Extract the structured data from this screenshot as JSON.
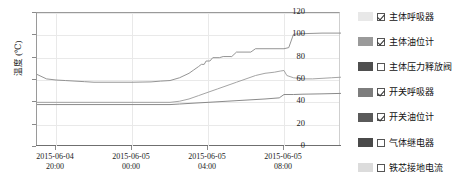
{
  "chart_data": {
    "type": "line",
    "title": "",
    "xlabel": "",
    "ylabel": "温度 (℃)",
    "ylim": [
      0,
      120
    ],
    "yticks": [
      0,
      20,
      40,
      60,
      80,
      100,
      120
    ],
    "grid": true,
    "legend_position": "right",
    "x_ticklabels": [
      {
        "date": "2015-06-04",
        "time": "20:00"
      },
      {
        "date": "2015-06-05",
        "time": "00:00"
      },
      {
        "date": "2015-06-05",
        "time": "04:00"
      },
      {
        "date": "2015-06-05",
        "time": "08:00"
      }
    ],
    "x_range_hours": [
      18,
      10
    ],
    "series": [
      {
        "name": "主体呼吸器",
        "color": "#e8e8e8",
        "visible": true,
        "points": [
          [
            0,
            65
          ],
          [
            1,
            61
          ],
          [
            2,
            60
          ],
          [
            3,
            59.5
          ],
          [
            4,
            59
          ],
          [
            5,
            58.5
          ],
          [
            6,
            58
          ],
          [
            8,
            58
          ],
          [
            10,
            58
          ],
          [
            12,
            58.3
          ],
          [
            13,
            59
          ],
          [
            14,
            59.5
          ],
          [
            15,
            62
          ],
          [
            16,
            66
          ],
          [
            16.5,
            69
          ],
          [
            17,
            72
          ],
          [
            17.3,
            74
          ],
          [
            17.6,
            74
          ],
          [
            17.8,
            77
          ],
          [
            18.2,
            77
          ],
          [
            18.5,
            80
          ],
          [
            19.2,
            80
          ],
          [
            19.6,
            81
          ],
          [
            20.5,
            81
          ],
          [
            21,
            85
          ],
          [
            22.5,
            85
          ],
          [
            23,
            88
          ],
          [
            26,
            88
          ],
          [
            26.5,
            89
          ],
          [
            27,
            101
          ],
          [
            28,
            101.5
          ],
          [
            30,
            102
          ],
          [
            32,
            102
          ]
        ]
      },
      {
        "name": "主体油位计",
        "color": "#9a9a9a",
        "visible": true,
        "points": [
          [
            0,
            40
          ],
          [
            4,
            40
          ],
          [
            8,
            40
          ],
          [
            12,
            40
          ],
          [
            14,
            40
          ],
          [
            15,
            41
          ],
          [
            16,
            43
          ],
          [
            17,
            46
          ],
          [
            18,
            49
          ],
          [
            19,
            52
          ],
          [
            20,
            55
          ],
          [
            21,
            58
          ],
          [
            22,
            61
          ],
          [
            23,
            64
          ],
          [
            24,
            66
          ],
          [
            25,
            67
          ],
          [
            25.6,
            68
          ],
          [
            26,
            68.5
          ],
          [
            26.3,
            64
          ],
          [
            27,
            62
          ],
          [
            28,
            61
          ],
          [
            29,
            61
          ],
          [
            30,
            61.5
          ],
          [
            31,
            62
          ],
          [
            32,
            62.5
          ]
        ]
      },
      {
        "name": "主体压力释放阀",
        "color": "#4f4f4f",
        "visible": false,
        "points": []
      },
      {
        "name": "开关呼吸器",
        "color": "#7d7d7d",
        "visible": true,
        "points": [
          [
            0,
            38
          ],
          [
            4,
            38
          ],
          [
            8,
            38
          ],
          [
            12,
            38
          ],
          [
            14,
            38
          ],
          [
            15,
            38.5
          ],
          [
            16,
            39
          ],
          [
            18,
            40
          ],
          [
            20,
            41
          ],
          [
            22,
            42
          ],
          [
            24,
            43
          ],
          [
            25.5,
            44
          ],
          [
            26,
            47
          ],
          [
            27,
            47
          ],
          [
            28,
            47.3
          ],
          [
            30,
            47.6
          ],
          [
            32,
            48
          ]
        ]
      },
      {
        "name": "开关油位计",
        "color": "#5a5a5a",
        "visible": true,
        "points": []
      },
      {
        "name": "气体继电器",
        "color": "#4a4a4a",
        "visible": false,
        "points": []
      },
      {
        "name": "铁芯接地电流",
        "color": "#dcdcdc",
        "visible": false,
        "points": []
      }
    ]
  },
  "legend": {
    "items": [
      {
        "label": "主体呼吸器",
        "checked": true,
        "swatch": "#e8e8e8"
      },
      {
        "label": "主体油位计",
        "checked": true,
        "swatch": "#9a9a9a"
      },
      {
        "label": "主体压力释放阀",
        "checked": false,
        "swatch": "#4f4f4f"
      },
      {
        "label": "开关呼吸器",
        "checked": true,
        "swatch": "#7d7d7d"
      },
      {
        "label": "开关油位计",
        "checked": true,
        "swatch": "#5a5a5a"
      },
      {
        "label": "气体继电器",
        "checked": false,
        "swatch": "#4a4a4a"
      },
      {
        "label": "铁芯接地电流",
        "checked": false,
        "swatch": "#dcdcdc"
      }
    ]
  }
}
